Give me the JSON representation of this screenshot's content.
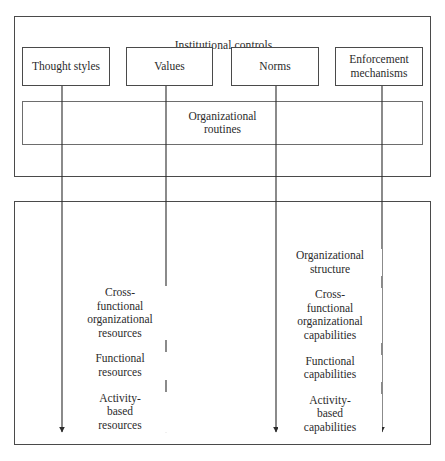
{
  "diagram": {
    "upper_section": {
      "title": "Institutional controls",
      "control_boxes": [
        {
          "label": "Thought styles"
        },
        {
          "label": "Values"
        },
        {
          "label": "Norms"
        },
        {
          "label": "Enforcement\nmechanisms"
        }
      ],
      "routines_band": {
        "label": "Organizational\nroutines"
      }
    },
    "lower_section": {
      "left_column": [
        "Cross-\nfunctional\norganizational\nresources",
        "Functional\nresources",
        "Activity-\nbased\nresources"
      ],
      "right_column": [
        "Organizational\nstructure",
        "Cross-\nfunctional\norganizational\ncapabilities",
        "Functional\ncapabilities",
        "Activity-\nbased\ncapabilities"
      ]
    },
    "arrows": [
      {
        "name": "arrow-thought-styles",
        "x": 62
      },
      {
        "name": "arrow-values",
        "x": 166
      },
      {
        "name": "arrow-norms",
        "x": 276
      },
      {
        "name": "arrow-enforcement-mechanisms",
        "x": 382
      }
    ],
    "colors": {
      "stroke": "#4a4a4a",
      "text": "#2b2b2b",
      "background": "#ffffff"
    }
  }
}
